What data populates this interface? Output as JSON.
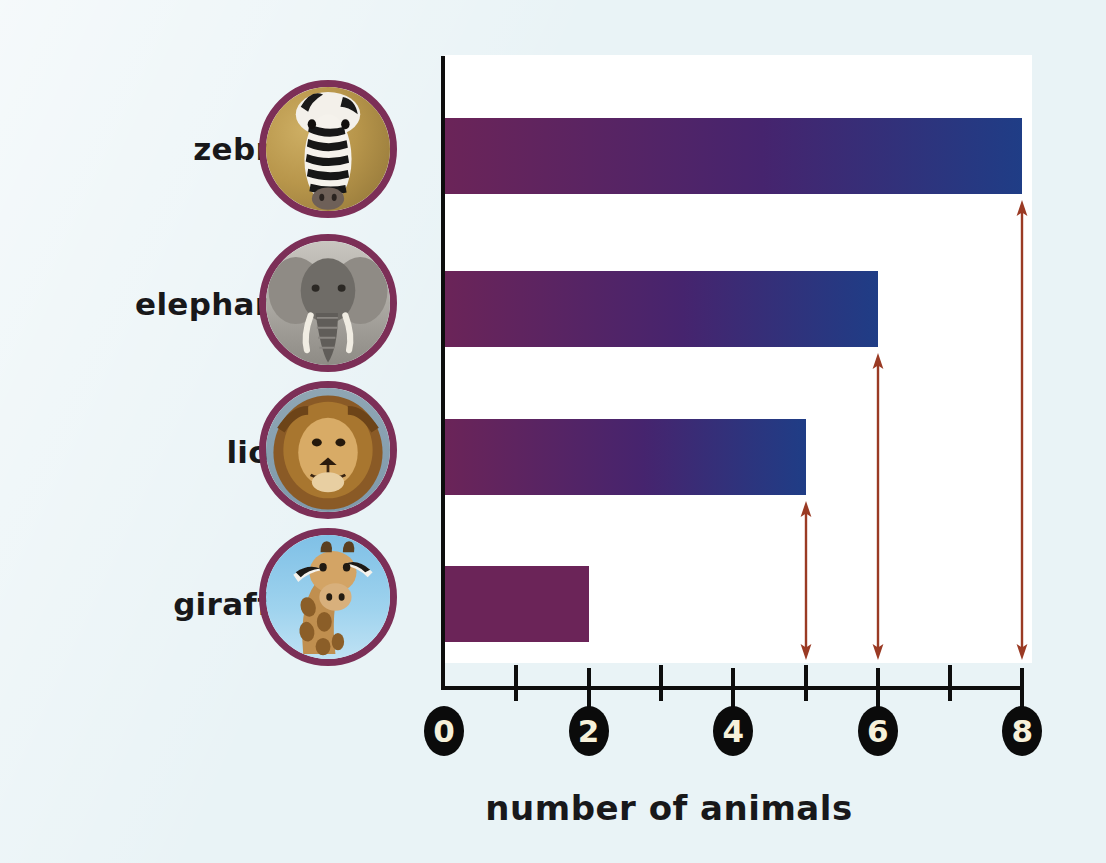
{
  "chart_data": {
    "type": "bar",
    "orientation": "horizontal",
    "title": "",
    "xlabel": "number of animals",
    "ylabel": "",
    "categories": [
      "zebras",
      "elephants",
      "lions",
      "giraffes"
    ],
    "values": [
      8,
      6,
      5,
      2
    ],
    "xlim": [
      0,
      8
    ],
    "xticks": [
      0,
      1,
      2,
      3,
      4,
      5,
      6,
      7,
      8
    ],
    "xtick_labels": [
      "0",
      "",
      "2",
      "",
      "4",
      "",
      "6",
      "",
      "8"
    ],
    "labeled_ticks": [
      "0",
      "2",
      "4",
      "6",
      "8"
    ],
    "grid": false,
    "legend": false,
    "bar_gradient": {
      "start_color": "#6b2458",
      "end_color": "#1f3d86"
    },
    "annotations": [
      {
        "category": "zebras",
        "value": 8,
        "type": "double-headed-arrow",
        "color": "#9a3a24"
      },
      {
        "category": "elephants",
        "value": 6,
        "type": "double-headed-arrow",
        "color": "#9a3a24"
      },
      {
        "category": "lions",
        "value": 5,
        "type": "double-headed-arrow",
        "color": "#9a3a24"
      }
    ]
  },
  "page": {
    "background_color": "#e9f3f6",
    "plot_background_color": "#ffffff",
    "axis_color": "#0d0d0d",
    "photo_ring_color": "#7c2f57",
    "axis_bubble_fill": "#0b0b0b",
    "axis_bubble_text_color": "#f6f1da"
  },
  "axis": {
    "title": "number of animals",
    "numbers": [
      {
        "label": "0",
        "value": 0
      },
      {
        "label": "2",
        "value": 2
      },
      {
        "label": "4",
        "value": 4
      },
      {
        "label": "6",
        "value": 6
      },
      {
        "label": "8",
        "value": 8
      }
    ]
  },
  "rows": [
    {
      "label": "zebras",
      "value": 8,
      "photo": "zebra-photo"
    },
    {
      "label": "elephants",
      "value": 6,
      "photo": "elephant-photo"
    },
    {
      "label": "lions",
      "value": 5,
      "photo": "lion-photo"
    },
    {
      "label": "giraffes",
      "value": 2,
      "photo": "giraffe-photo"
    }
  ]
}
